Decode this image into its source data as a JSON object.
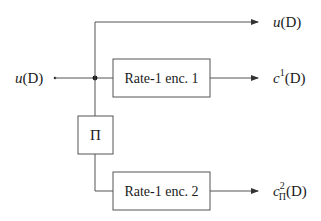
{
  "diagram": {
    "input": {
      "label_var": "u",
      "label_arg": "(D)"
    },
    "interleaver": {
      "label": "Π"
    },
    "encoder1": {
      "label": "Rate-1 enc. 1"
    },
    "encoder2": {
      "label": "Rate-1 enc. 2"
    },
    "outputs": {
      "systematic": {
        "var": "u",
        "arg": "(D)"
      },
      "parity1": {
        "var": "c",
        "sup": "1",
        "arg": "(D)"
      },
      "parity2": {
        "var": "c",
        "sup": "2",
        "sub": "Π",
        "arg": "(D)"
      }
    },
    "colors": {
      "line": "#555555",
      "text": "#1a1a1a",
      "background": "#ffffff"
    }
  }
}
